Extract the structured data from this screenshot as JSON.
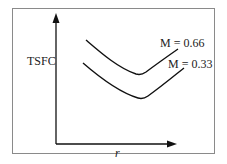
{
  "diagram": {
    "y_axis_label": "TSFC",
    "x_axis_label": "r",
    "curves": [
      {
        "label": "M = 0.66",
        "position": "upper"
      },
      {
        "label": "M = 0.33",
        "position": "lower"
      }
    ],
    "colors": {
      "line": "#111111",
      "frame": "#8a8a8a",
      "background": "#ffffff"
    }
  }
}
